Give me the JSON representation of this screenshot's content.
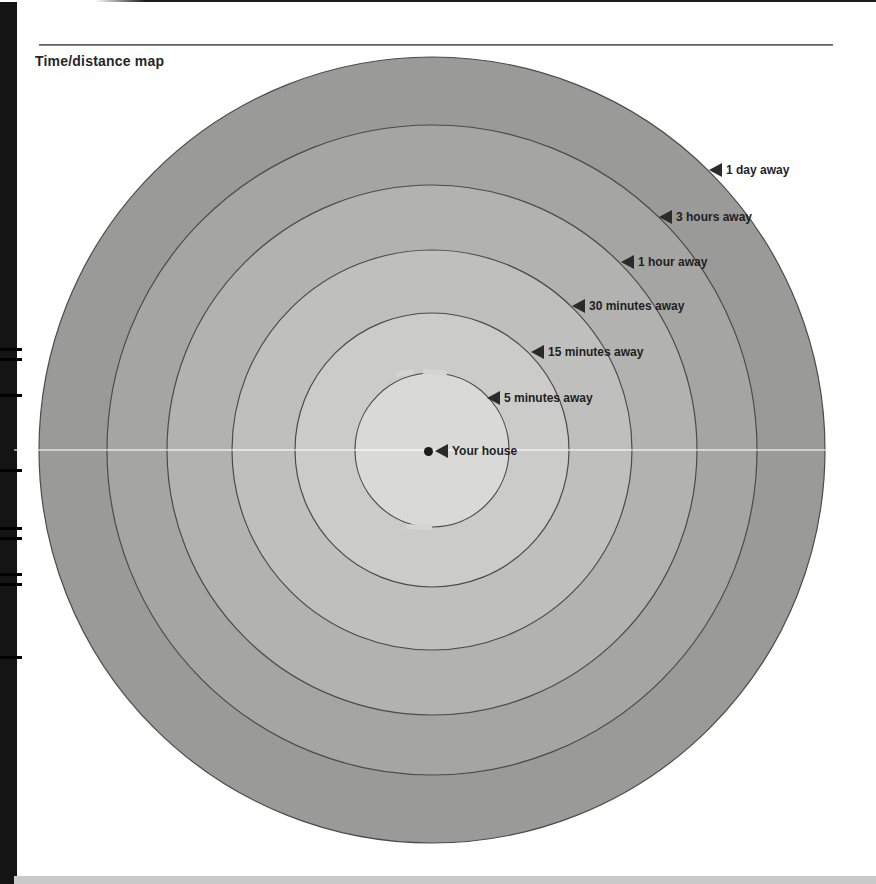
{
  "page": {
    "title": "Time/distance map"
  },
  "map": {
    "center_label": "Your house",
    "center": {
      "x": 432,
      "y": 450
    },
    "stroke_color": "#4b4b4b",
    "label_color": "#1f1f1f",
    "rings": [
      {
        "id": "1-day",
        "label": "1 day away",
        "radius": 393,
        "fill": "#9a9a98",
        "tip_x": 709,
        "tip_y": 170
      },
      {
        "id": "3-hours",
        "label": "3 hours away",
        "radius": 325,
        "fill": "#a5a5a3",
        "tip_x": 659,
        "tip_y": 217
      },
      {
        "id": "1-hour",
        "label": "1 hour away",
        "radius": 265,
        "fill": "#b2b2b0",
        "tip_x": 621,
        "tip_y": 262
      },
      {
        "id": "30-minutes",
        "label": "30 minutes away",
        "radius": 200,
        "fill": "#bfbfbd",
        "tip_x": 572,
        "tip_y": 306
      },
      {
        "id": "15-minutes",
        "label": "15 minutes away",
        "radius": 137,
        "fill": "#cbcbc9",
        "tip_x": 531,
        "tip_y": 352
      },
      {
        "id": "5-minutes",
        "label": "5 minutes away",
        "radius": 77,
        "fill": "#d9d9d7",
        "tip_x": 487,
        "tip_y": 398
      }
    ]
  }
}
